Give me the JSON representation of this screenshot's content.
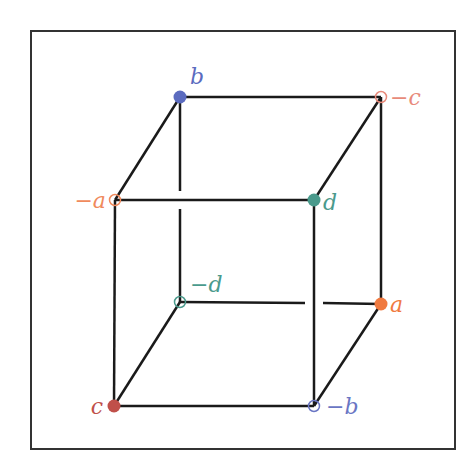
{
  "diagram": {
    "type": "cube-vertex-labeling",
    "frame": {
      "x": 31,
      "y": 31,
      "w": 424,
      "h": 418,
      "stroke": "#333333"
    },
    "edge_color": "#1a1a1a",
    "vertices": [
      {
        "id": "b",
        "label": "b",
        "x": 180,
        "y": 97,
        "filled": true,
        "color": "#5b6bbf",
        "lx": 190,
        "ly": 84,
        "anchor": "start"
      },
      {
        "id": "neg-c",
        "label": "−c",
        "x": 381,
        "y": 97,
        "filled": false,
        "color": "#e88a7a",
        "lx": 390,
        "ly": 105,
        "anchor": "start"
      },
      {
        "id": "neg-a",
        "label": "−a",
        "x": 115,
        "y": 200,
        "filled": false,
        "color": "#f08a5d",
        "lx": 106,
        "ly": 208,
        "anchor": "end"
      },
      {
        "id": "d",
        "label": "d",
        "x": 314,
        "y": 200,
        "filled": true,
        "color": "#4a9a8c",
        "lx": 323,
        "ly": 210,
        "anchor": "start"
      },
      {
        "id": "neg-d",
        "label": "−d",
        "x": 180,
        "y": 302,
        "filled": false,
        "color": "#4a9a8c",
        "lx": 190,
        "ly": 292,
        "anchor": "start"
      },
      {
        "id": "a",
        "label": "a",
        "x": 381,
        "y": 304,
        "filled": true,
        "color": "#f07a40",
        "lx": 390,
        "ly": 312,
        "anchor": "start"
      },
      {
        "id": "c",
        "label": "c",
        "x": 114,
        "y": 406,
        "filled": true,
        "color": "#c0504a",
        "lx": 103,
        "ly": 414,
        "anchor": "end"
      },
      {
        "id": "neg-b",
        "label": "−b",
        "x": 314,
        "y": 406,
        "filled": false,
        "color": "#6a76c4",
        "lx": 326,
        "ly": 414,
        "anchor": "start"
      }
    ],
    "edges": [
      [
        "b",
        "neg-c"
      ],
      [
        "b",
        "neg-a"
      ],
      [
        "neg-c",
        "d"
      ],
      [
        "neg-a",
        "d"
      ],
      [
        "neg-a",
        "c"
      ],
      [
        "d",
        "neg-b"
      ],
      [
        "c",
        "neg-b"
      ],
      [
        "neg-c",
        "a"
      ],
      [
        "neg-d",
        "c"
      ],
      [
        "a",
        "neg-b"
      ]
    ],
    "hidden_edges": [
      {
        "from": "b",
        "to": "neg-d",
        "gap_at": [
          180,
          200
        ]
      },
      {
        "from": "neg-d",
        "to": "a",
        "gap_at": [
          314,
          303
        ]
      }
    ]
  }
}
